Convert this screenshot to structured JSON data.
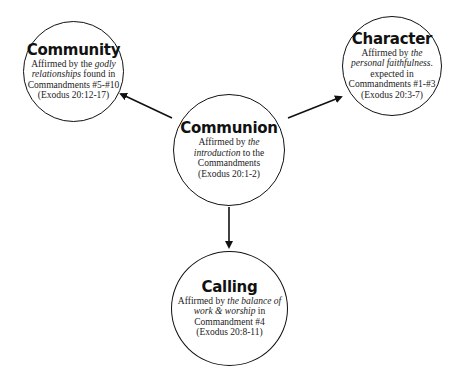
{
  "diagram": {
    "center": {
      "title": "Communion",
      "line1_pre": "Affirmed by ",
      "line1_em": "the",
      "line2_em": "introduction",
      "line2_post": " to the",
      "line3": "Commandments",
      "line4": "(Exodus 20:1-2)"
    },
    "left": {
      "title": "Community",
      "line1_pre": "Affirmed by the ",
      "line1_em": "godly",
      "line2_em": "relationships",
      "line2_post": " found in",
      "line3": "Commandments #5-#10",
      "line4": "(Exodus 20:12-17)"
    },
    "right": {
      "title": "Character",
      "line1_pre": "Affirmed by ",
      "line1_em": "the",
      "line2_em": "personal faithfulness",
      "line2_post": ".",
      "line3a": "expected in",
      "line3": "Commandments #1-#3",
      "line4": "(Exodus 20:3-7)"
    },
    "bottom": {
      "title": "Calling",
      "line1_pre": "Affirmed by ",
      "line1_em": "the balance of",
      "line2_em": "work & worship",
      "line2_post": " in",
      "line3": "Commandment #4",
      "line4": "(Exodus 20:8-11)"
    },
    "colors": {
      "stroke": "#111111",
      "background": "#ffffff"
    }
  }
}
